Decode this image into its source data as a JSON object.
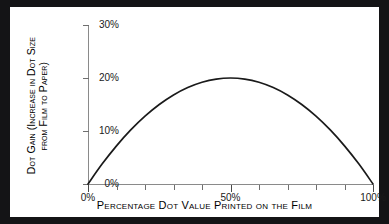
{
  "chart_data": {
    "type": "line",
    "title": "",
    "xlabel": "Percentage Dot Value Printed on the Film",
    "ylabel_line1": "Dot Gain (Increase in Dot Size",
    "ylabel_line2": "from Film to Paper)",
    "xlim": [
      0,
      100
    ],
    "ylim": [
      0,
      30
    ],
    "grid": false,
    "legend": "none",
    "x_tick_labels": [
      "0%",
      "50%",
      "100%"
    ],
    "x_tick_values": [
      0,
      50,
      100
    ],
    "x_minor_tick_values": [
      0,
      10,
      20,
      30,
      40,
      50,
      60,
      70,
      80,
      90,
      100
    ],
    "y_tick_labels": [
      "0%",
      "10%",
      "20%",
      "30%"
    ],
    "y_tick_values": [
      0,
      10,
      20,
      30
    ],
    "series": [
      {
        "name": "Dot gain",
        "x": [
          0,
          5,
          10,
          15,
          20,
          25,
          30,
          35,
          40,
          45,
          50,
          55,
          60,
          65,
          70,
          75,
          80,
          85,
          90,
          95,
          100
        ],
        "values": [
          0.0,
          3.8,
          7.2,
          10.2,
          12.8,
          15.0,
          16.8,
          18.2,
          19.2,
          19.8,
          20.0,
          19.8,
          19.2,
          18.2,
          16.8,
          15.0,
          12.8,
          10.2,
          7.2,
          3.8,
          0.0
        ]
      }
    ]
  },
  "style": {
    "frame_color": "#141416",
    "plate_color": "#ffffff",
    "curve_color": "#1a1a1a",
    "axis_color": "#8a8a8a",
    "text_color": "#000000"
  }
}
